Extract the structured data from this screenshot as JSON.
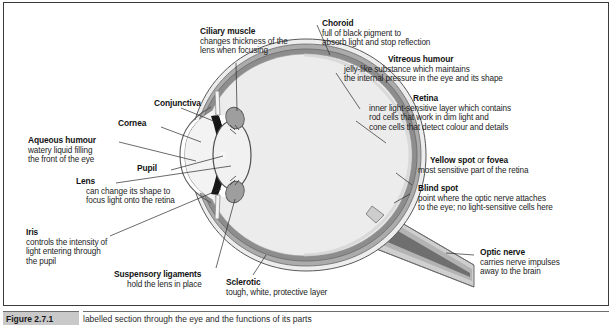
{
  "figure": {
    "title_visible": false,
    "caption": {
      "number": "Figure 2.7.1",
      "text": "labelled section through the eye and the functions of its parts"
    },
    "colors": {
      "sclerotic": "#e6e6e6",
      "choroid": "#a8a8a8",
      "retina": "#8f8f8f",
      "vitreous": "#ebebeb",
      "iris": "#1a1a1a",
      "ciliary_muscle": "#9a9a9a",
      "optic_nerve": "#8c8c8c",
      "outline": "#4a4a4a",
      "border": "#3b3b3b",
      "text": "#141414"
    }
  },
  "labels": [
    {
      "id": "ciliary-muscle",
      "term": "Ciliary muscle",
      "term_plain": "",
      "desc": [
        "changes thickness of the",
        "lens when focusing"
      ]
    },
    {
      "id": "conjunctiva",
      "term": "Conjunctiva",
      "term_plain": "",
      "desc": []
    },
    {
      "id": "cornea",
      "term": "Cornea",
      "term_plain": "",
      "desc": []
    },
    {
      "id": "aqueous-humour",
      "term": "Aqueous humour",
      "term_plain": "",
      "desc": [
        "watery liquid filling",
        "the front of the eye"
      ]
    },
    {
      "id": "pupil",
      "term": "Pupil",
      "term_plain": "",
      "desc": []
    },
    {
      "id": "lens",
      "term": "Lens",
      "term_plain": "",
      "desc": [
        "can change its shape to",
        "focus light onto the retina"
      ]
    },
    {
      "id": "iris",
      "term": "Iris",
      "term_plain": "",
      "desc": [
        "controls the intensity of",
        "light entering through",
        "the pupil"
      ]
    },
    {
      "id": "suspensory-ligaments",
      "term": "Suspensory ligaments",
      "term_plain": "",
      "desc": [
        "hold the lens in place"
      ]
    },
    {
      "id": "sclerotic",
      "term": "Sclerotic",
      "term_plain": "",
      "desc": [
        "tough, white, protective layer"
      ]
    },
    {
      "id": "choroid",
      "term": "Choroid",
      "term_plain": "",
      "desc": [
        "full of black pigment to",
        "absorb light and stop reflection"
      ]
    },
    {
      "id": "vitreous-humour",
      "term": "Vitreous humour",
      "term_plain": "",
      "desc": [
        "jelly-like substance which maintains",
        "the internal pressure in the eye and its shape"
      ]
    },
    {
      "id": "retina",
      "term": "Retina",
      "term_plain": "",
      "desc": [
        "inner light-sensitive layer which contains",
        "rod cells that work in dim light and",
        "cone cells that detect colour and details"
      ]
    },
    {
      "id": "yellow-spot",
      "term": "Yellow spot",
      "term_mid": " or ",
      "term2": "fovea",
      "desc": [
        "most sensitive part of the retina"
      ]
    },
    {
      "id": "blind-spot",
      "term": "Blind spot",
      "term_plain": "",
      "desc": [
        "point where the optic nerve attaches",
        "to the eye; no light-sensitive cells here"
      ]
    },
    {
      "id": "optic-nerve",
      "term": "Optic nerve",
      "term_plain": "",
      "desc": [
        "carries nerve impulses",
        "away to the brain"
      ]
    }
  ],
  "anatomy_parts": [
    "sclerotic",
    "choroid",
    "retina",
    "vitreous humour",
    "lens",
    "pupil",
    "iris",
    "cornea",
    "conjunctiva",
    "ciliary muscle",
    "suspensory ligaments",
    "yellow spot",
    "blind spot",
    "optic nerve",
    "aqueous humour"
  ]
}
